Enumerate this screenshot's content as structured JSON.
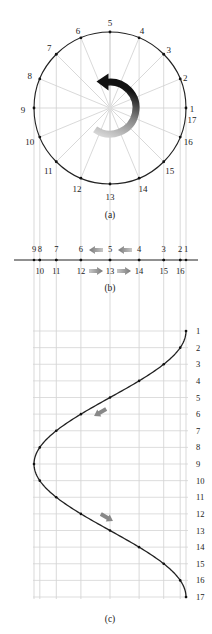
{
  "figure": {
    "panels": [
      {
        "id": "a",
        "caption": "(a)"
      },
      {
        "id": "b",
        "caption": "(b)"
      },
      {
        "id": "c",
        "caption": "(c)"
      }
    ],
    "circle": {
      "center": [
        110,
        108
      ],
      "radius": 76,
      "points": [
        {
          "label": "1",
          "angle_deg": 0
        },
        {
          "label": "2",
          "angle_deg": 22.5
        },
        {
          "label": "3",
          "angle_deg": 45
        },
        {
          "label": "4",
          "angle_deg": 67.5
        },
        {
          "label": "5",
          "angle_deg": 90
        },
        {
          "label": "6",
          "angle_deg": 112.5
        },
        {
          "label": "7",
          "angle_deg": 135
        },
        {
          "label": "8",
          "angle_deg": 157.5
        },
        {
          "label": "9",
          "angle_deg": 180
        },
        {
          "label": "10",
          "angle_deg": 202.5
        },
        {
          "label": "11",
          "angle_deg": 225
        },
        {
          "label": "12",
          "angle_deg": 247.5
        },
        {
          "label": "13",
          "angle_deg": 270
        },
        {
          "label": "14",
          "angle_deg": 292.5
        },
        {
          "label": "15",
          "angle_deg": 315
        },
        {
          "label": "16",
          "angle_deg": 337.5
        },
        {
          "label": "17",
          "angle_deg": 360
        }
      ],
      "rotation_arrow": "counter-clockwise-arrow"
    },
    "line_b": {
      "top_labels": [
        "9",
        "8",
        "7",
        "6",
        "5",
        "4",
        "3",
        "2",
        "1"
      ],
      "bottom_labels": [
        "10",
        "11",
        "12",
        "13",
        "14",
        "15",
        "16"
      ],
      "arrows_top": "left-arrows",
      "arrows_bottom": "right-arrows"
    },
    "graph_c": {
      "row_labels": [
        "1",
        "2",
        "3",
        "4",
        "5",
        "6",
        "7",
        "8",
        "9",
        "10",
        "11",
        "12",
        "13",
        "14",
        "15",
        "16",
        "17"
      ]
    }
  }
}
